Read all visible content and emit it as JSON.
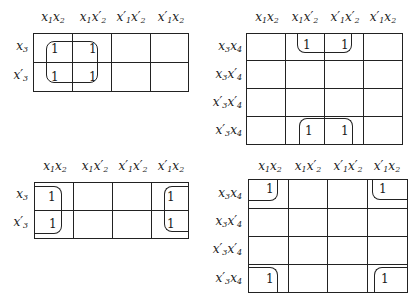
{
  "figure": {
    "maps": [
      {
        "id": "map-a",
        "columns": [
          "x1x2",
          "x1x2'",
          "x1'x2'",
          "x1'x2"
        ],
        "rows": [
          "x3",
          "x3'"
        ],
        "cells": [
          [
            "1",
            "1",
            "",
            ""
          ],
          [
            "1",
            "1",
            "",
            ""
          ]
        ],
        "groups": [
          "x1"
        ]
      },
      {
        "id": "map-b",
        "columns": [
          "x1x2",
          "x1x2'",
          "x1'x2'",
          "x1'x2"
        ],
        "rows": [
          "x3x4",
          "x3x4'",
          "x3'x4'",
          "x3'x4"
        ],
        "cells": [
          [
            "",
            "1",
            "1",
            ""
          ],
          [
            "",
            "",
            "",
            ""
          ],
          [
            "",
            "",
            "",
            ""
          ],
          [
            "",
            "1",
            "1",
            ""
          ]
        ],
        "groups": [
          "x2'x4 (wraps top/bottom)"
        ]
      },
      {
        "id": "map-c",
        "columns": [
          "x1x2",
          "x1x2'",
          "x1'x2'",
          "x1'x2"
        ],
        "rows": [
          "x3",
          "x3'"
        ],
        "cells": [
          [
            "1",
            "",
            "",
            "1"
          ],
          [
            "1",
            "",
            "",
            "1"
          ]
        ],
        "groups": [
          "x2 (wraps left/right)"
        ]
      },
      {
        "id": "map-d",
        "columns": [
          "x1x2",
          "x1x2'",
          "x1'x2'",
          "x1'x2"
        ],
        "rows": [
          "x3x4",
          "x3x4'",
          "x3'x4'",
          "x3'x4"
        ],
        "cells": [
          [
            "1",
            "",
            "",
            "1"
          ],
          [
            "",
            "",
            "",
            ""
          ],
          [
            "",
            "",
            "",
            ""
          ],
          [
            "1",
            "",
            "",
            "1"
          ]
        ],
        "groups": [
          "x2x4 (four corners)"
        ]
      }
    ],
    "value_one": "1"
  }
}
